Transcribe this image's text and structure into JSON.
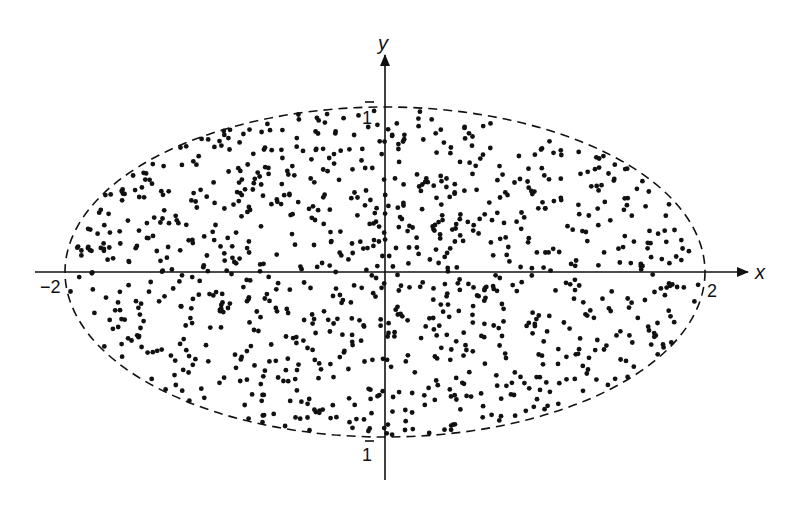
{
  "chart_data": {
    "type": "scatter",
    "title": "",
    "xlabel": "x",
    "ylabel": "y",
    "xlim": [
      -2.4,
      2.5
    ],
    "ylim": [
      -1.25,
      1.35
    ],
    "grid": false,
    "legend": "none",
    "boundary": {
      "shape": "ellipse",
      "equation": "x^2/4 + y^2 = 1",
      "semi_axis_x": 2,
      "semi_axis_y": 1,
      "style": "dashed"
    },
    "tick_labels": {
      "x_left": "−2",
      "x_right": "2",
      "y_top": "1",
      "y_bottom": "1"
    },
    "points": {
      "distribution": "uniform random inside ellipse x^2/4 + y^2 <= 1",
      "count": 1000,
      "seed": 12345
    },
    "colors": {
      "ink": "#111111",
      "background": "#ffffff"
    }
  }
}
